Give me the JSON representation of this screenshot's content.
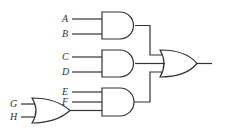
{
  "diagram": {
    "type": "logic-circuit",
    "stroke_color": "#333333",
    "inputs": [
      {
        "label": "A",
        "x": 62,
        "y": 14
      },
      {
        "label": "B",
        "x": 62,
        "y": 29
      },
      {
        "label": "C",
        "x": 62,
        "y": 52
      },
      {
        "label": "D",
        "x": 62,
        "y": 67
      },
      {
        "label": "E",
        "x": 62,
        "y": 87
      },
      {
        "label": "F",
        "x": 62,
        "y": 97
      },
      {
        "label": "G",
        "x": 10,
        "y": 99
      },
      {
        "label": "H",
        "x": 10,
        "y": 112
      }
    ],
    "gates": [
      {
        "id": "and1",
        "kind": "AND",
        "inputs": [
          "A",
          "B"
        ]
      },
      {
        "id": "and2",
        "kind": "AND",
        "inputs": [
          "C",
          "D"
        ]
      },
      {
        "id": "or_gh",
        "kind": "OR",
        "inputs": [
          "G",
          "H"
        ]
      },
      {
        "id": "and3",
        "kind": "AND",
        "inputs": [
          "E",
          "F",
          "or_gh"
        ]
      },
      {
        "id": "or_out",
        "kind": "OR",
        "inputs": [
          "and1",
          "and2",
          "and3"
        ]
      }
    ]
  }
}
